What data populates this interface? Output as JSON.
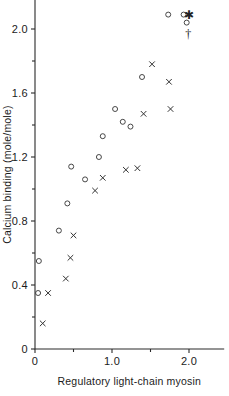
{
  "chart_data": {
    "type": "scatter",
    "title": "",
    "xlabel": "Regulatory light-chain myosin",
    "ylabel": "Calcium binding (mole/mole)",
    "xlim": [
      0,
      2.45
    ],
    "ylim": [
      0,
      2.18
    ],
    "grid": false,
    "legend": "none",
    "x_ticks_major": [
      0,
      1.0,
      2.0
    ],
    "x_ticklabels": [
      "0",
      "1.0",
      "2.0"
    ],
    "x_ticks_minor": [
      0.5,
      1.5
    ],
    "y_ticks_major": [
      0,
      0.4,
      0.8,
      1.2,
      1.6,
      2.0
    ],
    "y_ticklabels": [
      "0",
      "0.4",
      "0.8",
      "1.2",
      "1.6",
      "2.0"
    ],
    "y_ticks_minor": [
      0.2,
      0.6,
      1.0,
      1.4,
      1.8
    ],
    "series": [
      {
        "name": "open-circle",
        "marker": "circle",
        "points": [
          [
            0.04,
            0.35
          ],
          [
            0.05,
            0.55
          ],
          [
            0.31,
            0.74
          ],
          [
            0.42,
            0.91
          ],
          [
            0.47,
            1.14
          ],
          [
            0.65,
            1.06
          ],
          [
            0.83,
            1.2
          ],
          [
            0.88,
            1.33
          ],
          [
            1.04,
            1.5
          ],
          [
            1.14,
            1.42
          ],
          [
            1.24,
            1.39
          ],
          [
            1.39,
            1.7
          ],
          [
            1.73,
            2.09
          ],
          [
            1.93,
            2.09
          ],
          [
            1.97,
            2.04
          ]
        ]
      },
      {
        "name": "cross",
        "marker": "x",
        "points": [
          [
            0.1,
            0.16
          ],
          [
            0.17,
            0.35
          ],
          [
            0.4,
            0.44
          ],
          [
            0.46,
            0.57
          ],
          [
            0.5,
            0.71
          ],
          [
            0.78,
            0.99
          ],
          [
            0.88,
            1.07
          ],
          [
            1.18,
            1.12
          ],
          [
            1.33,
            1.13
          ],
          [
            1.41,
            1.47
          ],
          [
            1.52,
            1.78
          ],
          [
            1.74,
            1.67
          ],
          [
            1.76,
            1.5
          ]
        ]
      }
    ],
    "annotations": [
      {
        "symbol": "✱",
        "x": 2.0,
        "y": 2.09,
        "name": "asterisk-marker"
      },
      {
        "symbol": "†",
        "x": 1.99,
        "y": 1.97,
        "name": "dagger-marker"
      }
    ]
  }
}
